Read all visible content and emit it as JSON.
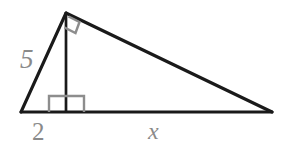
{
  "figure": {
    "type": "geometry-diagram",
    "background_color": "#ffffff",
    "stroke_color": "#1a1a1a",
    "label_color": "#8a8a8a",
    "right_angle_color": "#8d8d8d",
    "labels": {
      "leg_left": "5",
      "segment_left": "2",
      "segment_right": "x"
    },
    "vertices": {
      "apex": {
        "x": 66,
        "y": 13
      },
      "bottom_left": {
        "x": 21,
        "y": 112
      },
      "bottom_right": {
        "x": 272,
        "y": 112
      },
      "altitude_foot": {
        "x": 66,
        "y": 112
      }
    },
    "right_angles": [
      {
        "name": "apex-right-angle",
        "at": "apex"
      },
      {
        "name": "foot-right-angle",
        "at": "altitude_foot"
      }
    ],
    "label_positions": {
      "leg_left": {
        "x": 20,
        "y": 68
      },
      "segment_left": {
        "x": 32,
        "y": 140
      },
      "segment_right": {
        "x": 148,
        "y": 139
      }
    }
  }
}
